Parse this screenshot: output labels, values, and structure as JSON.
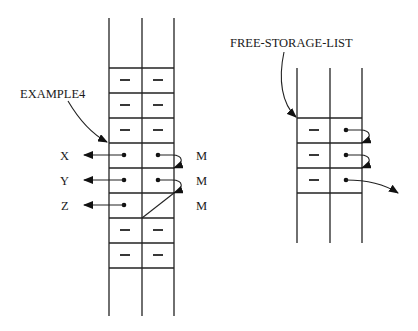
{
  "diagram": {
    "type": "memory-cell-layout",
    "left_block": {
      "label": "EXAMPLE4",
      "rows": [
        {
          "car": "",
          "cdr": ""
        },
        {
          "car": "—",
          "cdr": "—"
        },
        {
          "car": "—",
          "cdr": "—"
        },
        {
          "car": "—",
          "cdr": "—"
        },
        {
          "car": "•",
          "cdr": "•",
          "car_target": "X",
          "cdr_target": "M"
        },
        {
          "car": "•",
          "cdr": "•",
          "car_target": "Y",
          "cdr_target": "M"
        },
        {
          "car": "•",
          "cdr": "",
          "car_target": "Z",
          "cdr_target": "M"
        },
        {
          "car": "—",
          "cdr": "—"
        },
        {
          "car": "—",
          "cdr": "—"
        },
        {
          "car": "",
          "cdr": ""
        }
      ],
      "car_labels": [
        "X",
        "Y",
        "Z"
      ],
      "cdr_labels": [
        "M",
        "M",
        "M"
      ]
    },
    "right_block": {
      "label": "FREE-STORAGE-LIST",
      "rows": [
        {
          "car": "",
          "cdr": ""
        },
        {
          "car": "—",
          "cdr": "•"
        },
        {
          "car": "—",
          "cdr": "•"
        },
        {
          "car": "—",
          "cdr": "•"
        },
        {
          "car": "",
          "cdr": ""
        }
      ]
    },
    "dash_glyph": "—"
  }
}
